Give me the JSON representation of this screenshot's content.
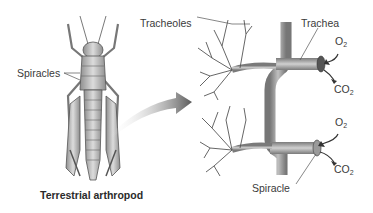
{
  "diagram": {
    "labels": {
      "spiracles": "Spiracles",
      "tracheoles": "Tracheoles",
      "trachea": "Trachea",
      "spiracle": "Spiracle",
      "o2_top": {
        "base": "O",
        "sub": "2"
      },
      "co2_top": {
        "base": "CO",
        "sub": "2"
      },
      "o2_bottom": {
        "base": "O",
        "sub": "2"
      },
      "co2_bottom": {
        "base": "CO",
        "sub": "2"
      }
    },
    "caption": "Terrestrial arthropod",
    "colors": {
      "background": "#ffffff",
      "insect_body": "#b8b8b8",
      "insect_outline": "#555555",
      "trachea_tube": "#a8a8a8",
      "arrow": "#6a6a6a",
      "text": "#3a3a3a"
    }
  }
}
